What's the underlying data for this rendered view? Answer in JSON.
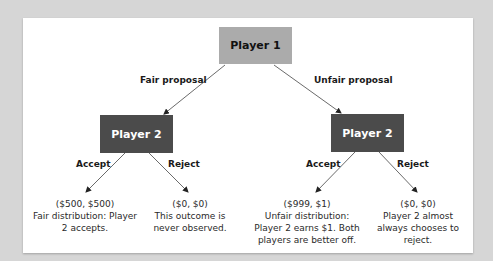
{
  "diagram": {
    "root": {
      "label": "Player 1",
      "fill": "#ababab"
    },
    "branches": [
      {
        "edge_label": "Fair proposal",
        "node": {
          "label": "Player 2",
          "fill": "#4b4b4b"
        },
        "choices": [
          {
            "label": "Accept",
            "payoff": "($500, $500)",
            "description": "Fair distribution: Player 2 accepts."
          },
          {
            "label": "Reject",
            "payoff": "($0, $0)",
            "description": "This outcome is never observed."
          }
        ]
      },
      {
        "edge_label": "Unfair proposal",
        "node": {
          "label": "Player 2",
          "fill": "#4b4b4b"
        },
        "choices": [
          {
            "label": "Accept",
            "payoff": "($999, $1)",
            "description": "Unfair distribution: Player 2 earns $1. Both players are better off."
          },
          {
            "label": "Reject",
            "payoff": "($0, $0)",
            "description": "Player 2 almost always chooses to reject."
          }
        ]
      }
    ]
  }
}
